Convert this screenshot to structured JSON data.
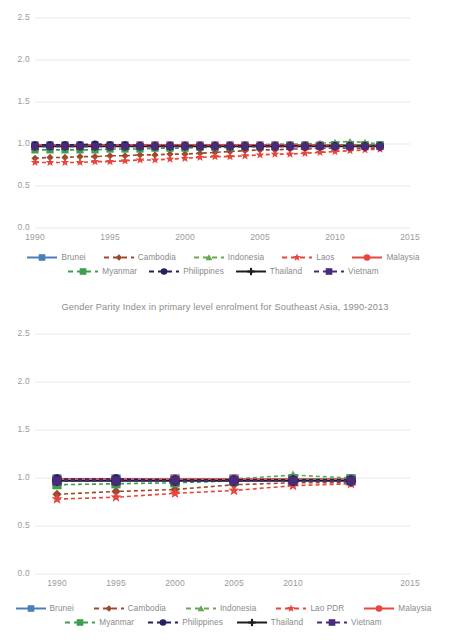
{
  "chart_data": [
    {
      "id": "top",
      "type": "line",
      "title": "",
      "xlabel": "",
      "ylabel": "",
      "xlim": [
        1990,
        2015
      ],
      "ylim": [
        0.0,
        2.5
      ],
      "xticks": [
        1990,
        1995,
        2000,
        2005,
        2010,
        2015
      ],
      "yticks": [
        "0.0",
        "0.5",
        "1.0",
        "1.5",
        "2.0",
        "2.5"
      ],
      "grid": true,
      "legend_position": "bottom",
      "x": [
        1990,
        1991,
        1992,
        1993,
        1994,
        1995,
        1996,
        1997,
        1998,
        1999,
        2000,
        2001,
        2002,
        2003,
        2004,
        2005,
        2006,
        2007,
        2008,
        2009,
        2010,
        2011,
        2012,
        2013
      ],
      "series": [
        {
          "name": "Brunei",
          "color": "#4a7ebb",
          "marker": "square",
          "dash": "solid",
          "values": [
            0.99,
            0.99,
            0.99,
            0.99,
            0.99,
            0.99,
            0.99,
            0.99,
            0.99,
            0.99,
            0.99,
            0.99,
            0.99,
            0.99,
            0.99,
            0.99,
            0.99,
            0.99,
            0.99,
            0.99,
            0.99,
            0.99,
            0.99,
            0.99
          ]
        },
        {
          "name": "Cambodia",
          "color": "#9c4a2f",
          "marker": "diamond",
          "dash": "dashed",
          "values": [
            0.83,
            0.84,
            0.84,
            0.85,
            0.85,
            0.86,
            0.86,
            0.87,
            0.87,
            0.88,
            0.88,
            0.89,
            0.9,
            0.91,
            0.92,
            0.93,
            0.93,
            0.94,
            0.94,
            0.95,
            0.95,
            0.95,
            0.95,
            0.95
          ]
        },
        {
          "name": "Indonesia",
          "color": "#6aa84f",
          "marker": "triangle",
          "dash": "dashed",
          "values": [
            0.97,
            0.97,
            0.97,
            0.97,
            0.97,
            0.97,
            0.97,
            0.97,
            0.97,
            0.97,
            0.98,
            0.98,
            0.98,
            0.99,
            0.99,
            0.99,
            1.0,
            1.0,
            1.0,
            1.01,
            1.02,
            1.03,
            1.02,
            1.0
          ]
        },
        {
          "name": "Laos",
          "color": "#e8453c",
          "marker": "star",
          "dash": "dashed",
          "values": [
            0.78,
            0.78,
            0.78,
            0.78,
            0.79,
            0.79,
            0.8,
            0.81,
            0.81,
            0.82,
            0.83,
            0.84,
            0.85,
            0.85,
            0.86,
            0.87,
            0.88,
            0.88,
            0.89,
            0.9,
            0.91,
            0.92,
            0.93,
            0.94
          ]
        },
        {
          "name": "Malaysia",
          "color": "#e8453c",
          "marker": "circle",
          "dash": "solid",
          "values": [
            0.99,
            0.99,
            0.99,
            0.99,
            0.99,
            0.99,
            0.99,
            0.99,
            0.99,
            0.99,
            0.99,
            0.99,
            0.99,
            0.99,
            0.99,
            0.99,
            0.99,
            0.99,
            0.99,
            0.99,
            0.99,
            0.99,
            0.99,
            0.99
          ]
        },
        {
          "name": "Myanmar",
          "color": "#3f9e4d",
          "marker": "square",
          "dash": "dashed",
          "values": [
            0.93,
            0.93,
            0.93,
            0.93,
            0.93,
            0.94,
            0.94,
            0.94,
            0.95,
            0.95,
            0.95,
            0.96,
            0.96,
            0.96,
            0.97,
            0.97,
            0.97,
            0.98,
            0.98,
            0.98,
            0.99,
            0.99,
            0.99,
            0.99
          ]
        },
        {
          "name": "Philippines",
          "color": "#23225e",
          "marker": "circle",
          "dash": "dashed",
          "values": [
            0.99,
            0.99,
            0.99,
            0.99,
            1.0,
            0.99,
            0.99,
            0.98,
            0.98,
            0.98,
            0.98,
            0.98,
            0.98,
            0.98,
            0.98,
            0.98,
            0.98,
            0.98,
            0.98,
            0.98,
            0.98,
            0.98,
            0.98,
            0.98
          ]
        },
        {
          "name": "Thailand",
          "color": "#1c1c1c",
          "marker": "plus",
          "dash": "solid",
          "values": [
            0.97,
            0.97,
            0.97,
            0.97,
            0.97,
            0.97,
            0.97,
            0.97,
            0.97,
            0.97,
            0.97,
            0.97,
            0.97,
            0.97,
            0.97,
            0.97,
            0.97,
            0.97,
            0.97,
            0.97,
            0.97,
            0.97,
            0.97,
            0.97
          ]
        },
        {
          "name": "Vietnam",
          "color": "#4a2a7a",
          "marker": "square",
          "dash": "dashed",
          "values": [
            0.97,
            0.97,
            0.97,
            0.97,
            0.97,
            0.97,
            0.97,
            0.97,
            0.97,
            0.97,
            0.97,
            0.97,
            0.97,
            0.97,
            0.97,
            0.97,
            0.97,
            0.97,
            0.97,
            0.97,
            0.97,
            0.97,
            0.97,
            0.97
          ]
        }
      ]
    },
    {
      "id": "bottom",
      "type": "line",
      "title": "Gender Parity Index in primary level enrolment for Southeast Asia, 1990-2013",
      "xlabel": "",
      "ylabel": "",
      "xlim": [
        1990,
        2015
      ],
      "ylim": [
        0.0,
        2.5
      ],
      "xticks": [
        1990,
        1995,
        2000,
        2005,
        2010,
        2015
      ],
      "yticks": [
        "0.0",
        "0.5",
        "1.0",
        "1.5",
        "2.0",
        "2.5"
      ],
      "grid": true,
      "legend_position": "bottom",
      "x": [
        1990,
        1995,
        2000,
        2005,
        2010,
        2013
      ],
      "series": [
        {
          "name": "Brunei",
          "color": "#4a7ebb",
          "marker": "square",
          "dash": "solid",
          "values": [
            0.99,
            0.99,
            0.99,
            0.99,
            0.99,
            0.99
          ]
        },
        {
          "name": "Cambodia",
          "color": "#9c4a2f",
          "marker": "diamond",
          "dash": "dashed",
          "values": [
            0.83,
            0.86,
            0.88,
            0.93,
            0.95,
            0.95
          ]
        },
        {
          "name": "Indonesia",
          "color": "#6aa84f",
          "marker": "triangle",
          "dash": "dashed",
          "values": [
            0.97,
            0.97,
            0.99,
            0.99,
            1.03,
            1.0
          ]
        },
        {
          "name": "Lao PDR",
          "color": "#e8453c",
          "marker": "star",
          "dash": "dashed",
          "values": [
            0.78,
            0.8,
            0.84,
            0.87,
            0.92,
            0.94
          ]
        },
        {
          "name": "Malaysia",
          "color": "#e8453c",
          "marker": "circle",
          "dash": "solid",
          "values": [
            0.99,
            0.99,
            0.99,
            0.99,
            0.99,
            0.99
          ]
        },
        {
          "name": "Myanmar",
          "color": "#3f9e4d",
          "marker": "square",
          "dash": "dashed",
          "values": [
            0.93,
            0.94,
            0.95,
            0.97,
            0.99,
            0.99
          ]
        },
        {
          "name": "Philippines",
          "color": "#23225e",
          "marker": "circle",
          "dash": "dashed",
          "values": [
            0.99,
            0.99,
            0.98,
            0.98,
            0.98,
            0.98
          ]
        },
        {
          "name": "Thailand",
          "color": "#1c1c1c",
          "marker": "plus",
          "dash": "solid",
          "values": [
            0.97,
            0.97,
            0.97,
            0.97,
            0.97,
            0.97
          ]
        },
        {
          "name": "Vietnam",
          "color": "#4a2a7a",
          "marker": "square",
          "dash": "dashed",
          "values": [
            0.97,
            0.97,
            0.97,
            0.97,
            0.97,
            0.97
          ]
        }
      ]
    }
  ],
  "top_chart": {
    "yticks": [
      "2.5",
      "2.0",
      "1.5",
      "1.0",
      "0.5",
      "0.0"
    ],
    "xticks": [
      "1990",
      "1995",
      "2000",
      "2005",
      "2010",
      "2015"
    ],
    "legend": {
      "row1": [
        {
          "label": "Brunei"
        },
        {
          "label": "Cambodia"
        },
        {
          "label": "Indonesia"
        },
        {
          "label": "Laos"
        },
        {
          "label": "Malaysia"
        }
      ],
      "row2": [
        {
          "label": "Myanmar"
        },
        {
          "label": "Philippines"
        },
        {
          "label": "Thailand"
        },
        {
          "label": "Vietnam"
        }
      ]
    }
  },
  "bottom_chart": {
    "title": "Gender Parity Index in primary level enrolment for Southeast Asia, 1990-2013",
    "yticks": [
      "2.5",
      "2.0",
      "1.5",
      "1.0",
      "0.5",
      "0.0"
    ],
    "xticks": [
      "1990",
      "1995",
      "2000",
      "2005",
      "2010",
      "2015"
    ],
    "legend": {
      "row1": [
        {
          "label": "Brunei"
        },
        {
          "label": "Cambodia"
        },
        {
          "label": "Indonesia"
        },
        {
          "label": "Lao PDR"
        },
        {
          "label": "Malaysia"
        }
      ],
      "row2": [
        {
          "label": "Myanmar"
        },
        {
          "label": "Philippines"
        },
        {
          "label": "Thailand"
        },
        {
          "label": "Vietnam"
        }
      ]
    }
  },
  "colors": {
    "brunei": "#4a7ebb",
    "cambodia": "#9c4a2f",
    "indonesia": "#6aa84f",
    "laos": "#e8453c",
    "malaysia": "#e8453c",
    "myanmar": "#3f9e4d",
    "philippines": "#23225e",
    "thailand": "#1c1c1c",
    "vietnam": "#4a2a7a",
    "gridline": "#e8e8e8",
    "tick_text": "#9a9a9a",
    "title_text": "#8b8b8b",
    "background": "#ffffff"
  }
}
